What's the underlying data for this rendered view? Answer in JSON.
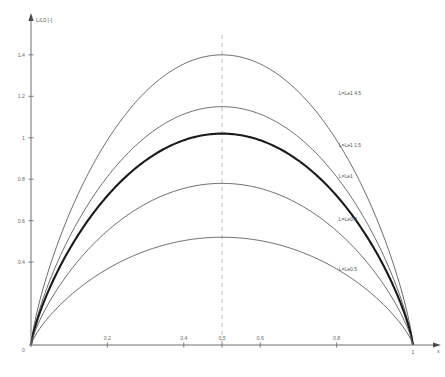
{
  "chart_data": {
    "type": "line",
    "title": "",
    "xlabel": "x",
    "ylabel": "L/L0 [-]",
    "xlim": [
      0,
      1.06
    ],
    "ylim": [
      0,
      1.52
    ],
    "grid": false,
    "legend_position": "inline-right-of-curve",
    "x_ticks": [
      "0.2",
      "0.4",
      "0.5",
      "0.6",
      "0.8"
    ],
    "x_tick_values": [
      0.2,
      0.4,
      0.5,
      0.6,
      0.8
    ],
    "x_axis_end_label": "1",
    "y_ticks": [
      "0.4",
      "0.6",
      "0.8",
      "1",
      "1.2",
      "1.4"
    ],
    "y_tick_values": [
      0.4,
      0.6,
      0.8,
      1.0,
      1.2,
      1.4
    ],
    "y_origin_label": "0",
    "annotations": [
      {
        "name": "center-dashed-line",
        "type": "vline",
        "x": 0.5,
        "style": "dashed"
      }
    ],
    "series": [
      {
        "name": "curve-1",
        "label": "L=Le1 4.5",
        "peak_x": 0.5,
        "peak_y": 1.4,
        "emphasis": false,
        "label_x": 0.79,
        "label_y": 1.205
      },
      {
        "name": "curve-2",
        "label": "L=Le1 1.5",
        "peak_x": 0.5,
        "peak_y": 1.15,
        "emphasis": false,
        "label_x": 0.79,
        "label_y": 0.955
      },
      {
        "name": "curve-3",
        "label": "L=Le1",
        "peak_x": 0.5,
        "peak_y": 1.02,
        "emphasis": true,
        "label_x": 0.79,
        "label_y": 0.805
      },
      {
        "name": "curve-4",
        "label": "L=Le0.8",
        "peak_x": 0.5,
        "peak_y": 0.78,
        "emphasis": false,
        "label_x": 0.79,
        "label_y": 0.598
      },
      {
        "name": "curve-5",
        "label": "L=Le0.5",
        "peak_x": 0.5,
        "peak_y": 0.52,
        "emphasis": false,
        "label_x": 0.79,
        "label_y": 0.355
      }
    ]
  }
}
